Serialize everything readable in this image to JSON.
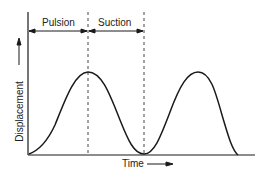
{
  "diagram": {
    "phases": [
      {
        "label": "Pulsion"
      },
      {
        "label": "Suction"
      }
    ],
    "xlabel": "Time",
    "ylabel": "Displacement",
    "colors": {
      "line": "#1a1a1a",
      "dash": "#444444"
    }
  }
}
